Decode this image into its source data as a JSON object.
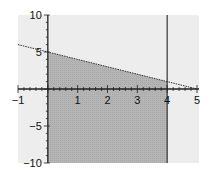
{
  "chart_data": {
    "type": "area",
    "title": "",
    "xlabel": "",
    "ylabel": "",
    "xlim": [
      -1,
      5
    ],
    "ylim": [
      -10,
      10
    ],
    "grid": false,
    "x_ticks": [
      -1,
      1,
      2,
      3,
      4,
      5
    ],
    "y_ticks": [
      -10,
      -5,
      5,
      10
    ],
    "x_tick_labels": [
      "−1",
      "1",
      "2",
      "3",
      "4",
      "5"
    ],
    "y_tick_labels": [
      "−10",
      "−5",
      "5",
      "10"
    ],
    "series": [
      {
        "name": "boundary line",
        "kind": "line",
        "style": "dotted",
        "x": [
          -1,
          5
        ],
        "y": [
          6,
          0
        ],
        "equation": "y = 5 - x"
      },
      {
        "name": "vertical line x=4",
        "kind": "line",
        "style": "solid",
        "x": [
          4,
          4
        ],
        "y": [
          -10,
          10
        ],
        "equation": "x = 4"
      },
      {
        "name": "feasible region",
        "kind": "shaded",
        "vertices": [
          [
            0,
            -10
          ],
          [
            0,
            5
          ],
          [
            4,
            1
          ],
          [
            4,
            -10
          ]
        ],
        "description": "x >= 0, x <= 4, y <= 5 - x"
      }
    ],
    "colors": {
      "plot_background": "#ededed",
      "shaded_region": "#b8b8b8",
      "axes": "#222222"
    }
  }
}
